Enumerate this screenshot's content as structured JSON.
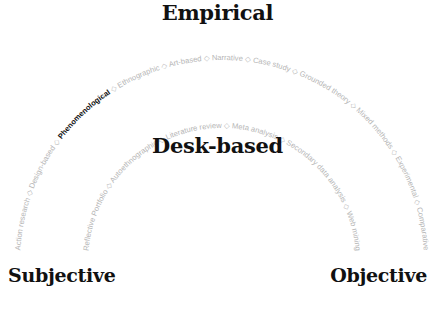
{
  "titles": {
    "top": "Empirical",
    "middle": "Desk-based",
    "left": "Subjective",
    "right": "Objective"
  },
  "separator": "◇",
  "outer_arc": {
    "items": [
      "Action research",
      "Design-based",
      "Phenomenological",
      "Ethnographic",
      "Art-based",
      "Narrative",
      "Case study",
      "Grounded theory",
      "Mixed methods",
      "Experimental",
      "Comparative"
    ],
    "highlighted": "Phenomenological"
  },
  "inner_arc": {
    "items": [
      "Reflective Portfolio",
      "Autoethnographic",
      "Literature review",
      "Meta analysis",
      "Secondary data analysis",
      "Web mining"
    ]
  },
  "colors": {
    "label": "#b5b5b5",
    "highlight": "#111111",
    "title": "#111111"
  }
}
